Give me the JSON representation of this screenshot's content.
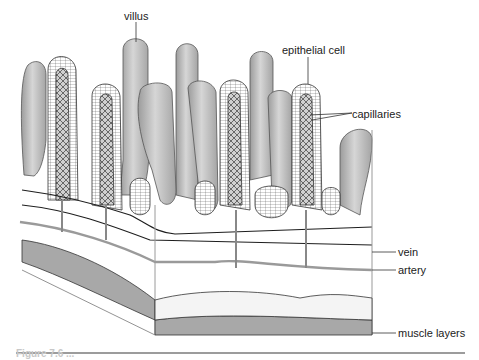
{
  "figure": {
    "type": "biology-diagram",
    "caption": "Figure 7.6 ..."
  },
  "labels": {
    "villus": "villus",
    "epithelial_cell": "epithelial cell",
    "capillaries": "capillaries",
    "vein": "vein",
    "artery": "artery",
    "muscle_layers": "muscle layers"
  },
  "colors": {
    "villus_fill": "#b8b8b8",
    "villus_highlight": "#d8d8d8",
    "outline": "#333333",
    "artery": "#9a9a9a",
    "vein": "#1e1e1e",
    "muscle": "#a8a8a8",
    "rule": "#3a3a3a"
  }
}
